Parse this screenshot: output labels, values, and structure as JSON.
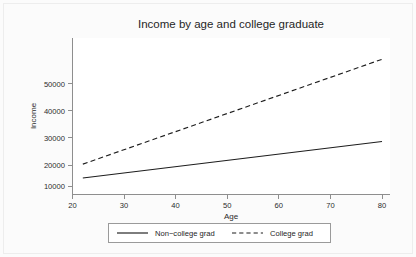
{
  "chart_data": {
    "type": "line",
    "title": "Income by age and college graduate",
    "xlabel": "Age",
    "ylabel": "Income",
    "xlim": [
      20,
      80
    ],
    "ylim": [
      8000,
      62000
    ],
    "xticks": [
      20,
      30,
      40,
      50,
      60,
      70,
      80
    ],
    "xtick_labels": [
      "20",
      "30",
      "40",
      "50",
      "60",
      "70",
      "80"
    ],
    "yticks": [
      10000,
      20000,
      30000,
      40000,
      50000
    ],
    "ytick_labels": [
      "10000",
      "20000",
      "30000",
      "40000",
      "50000"
    ],
    "grid": false,
    "legend_position": "bottom-outside",
    "series": [
      {
        "name": "Non-college grad",
        "style": "solid",
        "color": "#1d1d1d",
        "x": [
          22,
          80
        ],
        "values": [
          13300,
          27500
        ]
      },
      {
        "name": "College grad",
        "style": "dashed",
        "color": "#1d1d1d",
        "x": [
          22,
          80
        ],
        "values": [
          18700,
          59500
        ]
      }
    ]
  },
  "legend": {
    "entries": [
      {
        "label": "Non−college grad"
      },
      {
        "label": "College grad"
      }
    ]
  }
}
